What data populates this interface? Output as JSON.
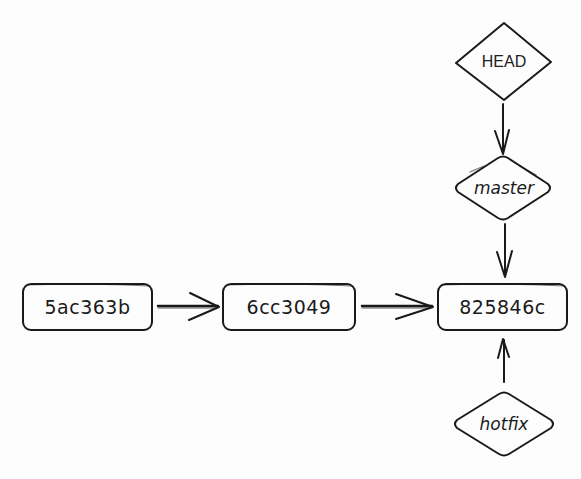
{
  "diagram": {
    "type": "git-commit-graph",
    "style": "hand-drawn",
    "colors": {
      "background": "#fdfdfd",
      "stroke": "#1a1a1a",
      "text": "#1a1a1a"
    },
    "commits": [
      {
        "id": "5ac363b",
        "label": "5ac363b"
      },
      {
        "id": "6cc3049",
        "label": "6cc3049"
      },
      {
        "id": "825846c",
        "label": "825846c"
      }
    ],
    "refs": {
      "head": {
        "label": "HEAD"
      },
      "master": {
        "label": "master"
      },
      "hotfix": {
        "label": "hotfix"
      }
    },
    "edges": [
      {
        "from": "5ac363b",
        "to": "6cc3049"
      },
      {
        "from": "6cc3049",
        "to": "825846c"
      },
      {
        "from": "HEAD",
        "to": "master"
      },
      {
        "from": "master",
        "to": "825846c"
      },
      {
        "from": "hotfix",
        "to": "825846c"
      }
    ]
  }
}
